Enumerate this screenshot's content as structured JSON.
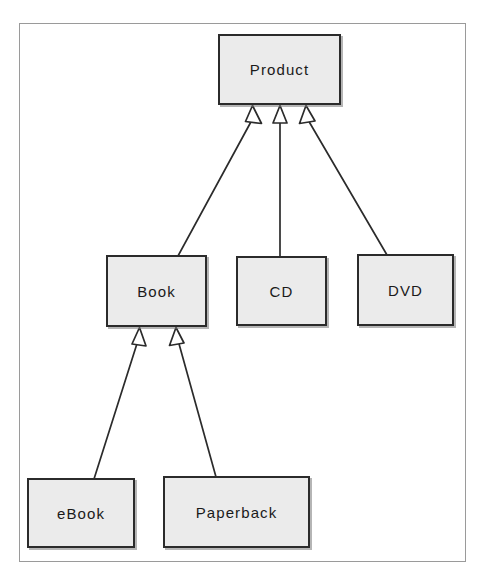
{
  "diagram": {
    "type": "uml-class-diagram",
    "frame": {
      "visible": true,
      "border_color": "#9a9a9a"
    },
    "style": {
      "box_fill": "#ebebeb",
      "box_border": "#2b2b2b",
      "line_color": "#2b2b2b",
      "text_color": "#1a1a1a",
      "background": "#ffffff",
      "arrowhead": "hollow-triangle"
    },
    "classes": [
      {
        "id": "product",
        "label": "Product",
        "x": 218,
        "y": 34,
        "w": 123,
        "h": 71
      },
      {
        "id": "book",
        "label": "Book",
        "x": 106,
        "y": 255,
        "w": 101,
        "h": 72
      },
      {
        "id": "cd",
        "label": "CD",
        "x": 236,
        "y": 256,
        "w": 91,
        "h": 70
      },
      {
        "id": "dvd",
        "label": "DVD",
        "x": 357,
        "y": 254,
        "w": 97,
        "h": 72
      },
      {
        "id": "ebook",
        "label": "eBook",
        "x": 27,
        "y": 478,
        "w": 108,
        "h": 70
      },
      {
        "id": "paperback",
        "label": "Paperback",
        "x": 163,
        "y": 476,
        "w": 147,
        "h": 72
      }
    ],
    "relationships": [
      {
        "id": "book-product",
        "type": "generalization",
        "from": "book",
        "to": "product"
      },
      {
        "id": "cd-product",
        "type": "generalization",
        "from": "cd",
        "to": "product"
      },
      {
        "id": "dvd-product",
        "type": "generalization",
        "from": "dvd",
        "to": "product"
      },
      {
        "id": "ebook-book",
        "type": "generalization",
        "from": "ebook",
        "to": "book"
      },
      {
        "id": "paperback-book",
        "type": "generalization",
        "from": "paperback",
        "to": "book"
      }
    ]
  }
}
